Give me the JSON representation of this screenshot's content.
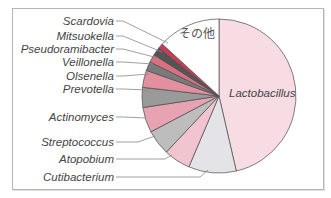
{
  "chart_data": {
    "type": "pie",
    "title": "",
    "start_angle_deg": 0,
    "direction": "clockwise",
    "slices": [
      {
        "label": "Lactobacillus",
        "value": 46.4,
        "color": "#f7dce4",
        "label_inside": true
      },
      {
        "label": "Cutibacterium",
        "value": 10.0,
        "color": "#e3e3e8"
      },
      {
        "label": "Atopobium",
        "value": 5.6,
        "color": "#f2c4cf"
      },
      {
        "label": "Streptococcus",
        "value": 5.3,
        "color": "#bdbdbd"
      },
      {
        "label": "Actinomyces",
        "value": 5.3,
        "color": "#e7a3b1"
      },
      {
        "label": "Prevotella",
        "value": 4.2,
        "color": "#9a9a9a"
      },
      {
        "label": "Olsenella",
        "value": 3.6,
        "color": "#e28fa0"
      },
      {
        "label": "Veillonella",
        "value": 1.9,
        "color": "#7a7a7a"
      },
      {
        "label": "Pseudoramibacter",
        "value": 1.7,
        "color": "#d9707f"
      },
      {
        "label": "Mitsuokella",
        "value": 1.7,
        "color": "#555555"
      },
      {
        "label": "Scardovia",
        "value": 1.1,
        "color": "#cc3a55"
      },
      {
        "label": "その他",
        "value": 13.2,
        "color": "#ffffff",
        "label_inside": true
      }
    ]
  },
  "labels": {
    "lactobacillus": "Lactobacillus",
    "other": "その他",
    "scardovia": "Scardovia",
    "mitsuokella": "Mitsuokella",
    "pseudoramibacter": "Pseudoramibacter",
    "veillonella": "Veillonella",
    "olsenella": "Olsenella",
    "prevotella": "Prevotella",
    "actinomyces": "Actinomyces",
    "streptococcus": "Streptococcus",
    "atopobium": "Atopobium",
    "cutibacterium": "Cutibacterium"
  }
}
